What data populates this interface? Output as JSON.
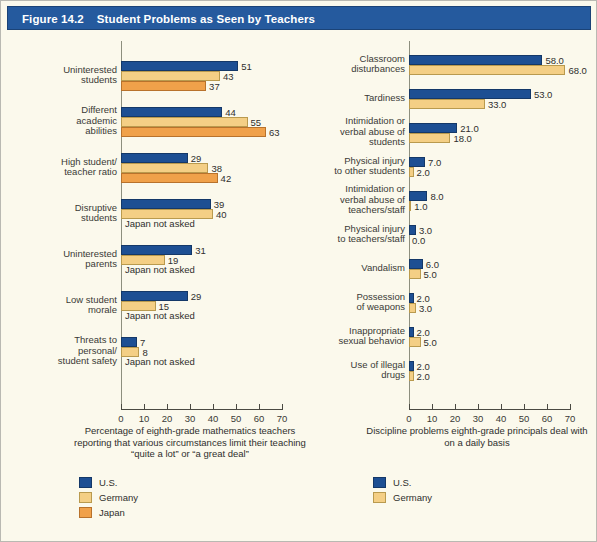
{
  "figure": {
    "number": "Figure 14.2",
    "title": "Student Problems as Seen by Teachers"
  },
  "colors": {
    "header_band": "#255a9e",
    "background": "#fbf9ec",
    "us": "#1d4f93",
    "germany": "#f4cf85",
    "japan": "#f0a14a"
  },
  "left": {
    "caption": "Percentage of eighth-grade mathematics teachers reporting that various circumstances limit their teaching “quite a lot” or “a great deal”",
    "not_asked_text": "Japan not asked",
    "axis": {
      "min": 0,
      "max": 70,
      "step": 10,
      "ticks": [
        "0",
        "10",
        "20",
        "30",
        "40",
        "50",
        "60",
        "70"
      ]
    },
    "legend": [
      {
        "key": "us",
        "label": "U.S."
      },
      {
        "key": "de",
        "label": "Germany"
      },
      {
        "key": "jp",
        "label": "Japan"
      }
    ],
    "categories": [
      {
        "label": "Uninterested\nstudents",
        "us": 51,
        "de": 43,
        "jp": 37
      },
      {
        "label": "Different\nacademic\nabilities",
        "us": 44,
        "de": 55,
        "jp": 63
      },
      {
        "label": "High student/\nteacher ratio",
        "us": 29,
        "de": 38,
        "jp": 42
      },
      {
        "label": "Disruptive\nstudents",
        "us": 39,
        "de": 40,
        "jp": null
      },
      {
        "label": "Uninterested\nparents",
        "us": 31,
        "de": 19,
        "jp": null
      },
      {
        "label": "Low student\nmorale",
        "us": 29,
        "de": 15,
        "jp": null
      },
      {
        "label": "Threats to\npersonal/\nstudent safety",
        "us": 7,
        "de": 8,
        "jp": null
      }
    ]
  },
  "right": {
    "caption": "Discipline problems eighth-grade principals deal with on a daily basis",
    "axis": {
      "min": 0,
      "max": 70,
      "step": 10,
      "ticks": [
        "0",
        "10",
        "20",
        "30",
        "40",
        "50",
        "60",
        "70"
      ]
    },
    "legend": [
      {
        "key": "us",
        "label": "U.S."
      },
      {
        "key": "de",
        "label": "Germany"
      }
    ],
    "categories": [
      {
        "label": "Classroom\ndisturbances",
        "us": 58.0,
        "de": 68.0
      },
      {
        "label": "Tardiness",
        "us": 53.0,
        "de": 33.0
      },
      {
        "label": "Intimidation or\nverbal abuse of\nstudents",
        "us": 21.0,
        "de": 18.0
      },
      {
        "label": "Physical injury\nto other students",
        "us": 7.0,
        "de": 2.0
      },
      {
        "label": "Intimidation or\nverbal abuse of\nteachers/staff",
        "us": 8.0,
        "de": 1.0
      },
      {
        "label": "Physical injury\nto teachers/staff",
        "us": 3.0,
        "de": 0.0
      },
      {
        "label": "Vandalism",
        "us": 6.0,
        "de": 5.0
      },
      {
        "label": "Possession\nof weapons",
        "us": 2.0,
        "de": 3.0
      },
      {
        "label": "Inappropriate\nsexual behavior",
        "us": 2.0,
        "de": 5.0
      },
      {
        "label": "Use of illegal\ndrugs",
        "us": 2.0,
        "de": 2.0
      }
    ]
  },
  "chart_data": {
    "type": "bar",
    "title": "Student Problems as Seen by Teachers",
    "orientation": "horizontal",
    "panels": [
      {
        "name": "left",
        "xlabel": "Percentage of eighth-grade mathematics teachers reporting that various circumstances limit their teaching “quite a lot” or “a great deal”",
        "ylabel": "",
        "xlim": [
          0,
          70
        ],
        "xticks": [
          0,
          10,
          20,
          30,
          40,
          50,
          60,
          70
        ],
        "grid": false,
        "legend_position": "bottom-left",
        "categories": [
          "Uninterested students",
          "Different academic abilities",
          "High student/teacher ratio",
          "Disruptive students",
          "Uninterested parents",
          "Low student morale",
          "Threats to personal/student safety"
        ],
        "series": [
          {
            "name": "U.S.",
            "values": [
              51,
              44,
              29,
              39,
              31,
              29,
              7
            ]
          },
          {
            "name": "Germany",
            "values": [
              43,
              55,
              38,
              40,
              19,
              15,
              8
            ]
          },
          {
            "name": "Japan",
            "values": [
              37,
              63,
              42,
              null,
              null,
              null,
              null
            ]
          }
        ],
        "annotations": [
          "Japan not asked"
        ]
      },
      {
        "name": "right",
        "xlabel": "Discipline problems eighth-grade principals deal with on a daily basis",
        "ylabel": "",
        "xlim": [
          0,
          70
        ],
        "xticks": [
          0,
          10,
          20,
          30,
          40,
          50,
          60,
          70
        ],
        "grid": false,
        "legend_position": "bottom-left",
        "categories": [
          "Classroom disturbances",
          "Tardiness",
          "Intimidation or verbal abuse of students",
          "Physical injury to other students",
          "Intimidation or verbal abuse of teachers/staff",
          "Physical injury to teachers/staff",
          "Vandalism",
          "Possession of weapons",
          "Inappropriate sexual behavior",
          "Use of illegal drugs"
        ],
        "series": [
          {
            "name": "U.S.",
            "values": [
              58.0,
              53.0,
              21.0,
              7.0,
              8.0,
              3.0,
              6.0,
              2.0,
              2.0,
              2.0
            ]
          },
          {
            "name": "Germany",
            "values": [
              68.0,
              33.0,
              18.0,
              2.0,
              1.0,
              0.0,
              5.0,
              3.0,
              5.0,
              2.0
            ]
          }
        ]
      }
    ]
  }
}
